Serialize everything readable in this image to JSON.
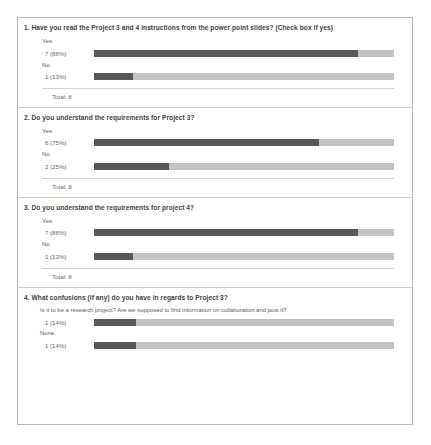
{
  "document": {
    "kind": "survey-results-summary",
    "colors": {
      "bar_fill": "#585858",
      "bar_track": "#c4c4c4",
      "page_border": "#b9b9b9",
      "text": "#5d5d63",
      "heading": "#3f3f46"
    }
  },
  "questions": [
    {
      "title": "1. Have you read the Project 3 and 4 instructions from the power point slides? (Check box if yes)",
      "answers": [
        {
          "label": "Yes",
          "count_text": "7 (88%)",
          "count": 7,
          "percent": 88
        },
        {
          "label": "No",
          "count_text": "1 (13%)",
          "count": 1,
          "percent": 13
        }
      ],
      "total_text": "Total: 8",
      "total": 8
    },
    {
      "title": "2. Do you understand the requirements for Project 3?",
      "answers": [
        {
          "label": "Yes",
          "count_text": "6 (75%)",
          "count": 6,
          "percent": 75
        },
        {
          "label": "No",
          "count_text": "2 (25%)",
          "count": 2,
          "percent": 25
        }
      ],
      "total_text": "Total: 8",
      "total": 8
    },
    {
      "title": "3. Do you understand the requirements for project 4?",
      "answers": [
        {
          "label": "Yes",
          "count_text": "7 (88%)",
          "count": 7,
          "percent": 88
        },
        {
          "label": "No",
          "count_text": "1 (13%)",
          "count": 1,
          "percent": 13
        }
      ],
      "total_text": "Total: 8",
      "total": 8
    },
    {
      "title": "4. What confusions (if any) do you have in regards to Project 3?",
      "answers": [
        {
          "label": "Is it to be a research project? Are we supposed to find information on collaboration and post it?",
          "count_text": "1 (14%)",
          "count": 1,
          "percent": 14,
          "freeform": true
        },
        {
          "label": "None.",
          "count_text": "1 (14%)",
          "count": 1,
          "percent": 14,
          "freeform": true
        }
      ],
      "total_text": "",
      "total": 7
    }
  ],
  "chart_data": {
    "type": "bar",
    "xlabel": "",
    "ylabel": "",
    "xlim": [
      0,
      100
    ],
    "grid": false,
    "legend": "none",
    "orientation": "horizontal",
    "groups": [
      {
        "question": "1. Have you read the Project 3 and 4 instructions from the power point slides? (Check box if yes)",
        "categories": [
          "Yes",
          "No"
        ],
        "values": [
          88,
          13
        ],
        "counts": [
          7,
          1
        ],
        "total": 8
      },
      {
        "question": "2. Do you understand the requirements for Project 3?",
        "categories": [
          "Yes",
          "No"
        ],
        "values": [
          75,
          25
        ],
        "counts": [
          6,
          2
        ],
        "total": 8
      },
      {
        "question": "3. Do you understand the requirements for project 4?",
        "categories": [
          "Yes",
          "No"
        ],
        "values": [
          88,
          13
        ],
        "counts": [
          7,
          1
        ],
        "total": 8
      },
      {
        "question": "4. What confusions (if any) do you have in regards to Project 3?",
        "categories": [
          "Is it to be a research project? Are we supposed to find information on collaboration and post it?",
          "None."
        ],
        "values": [
          14,
          14
        ],
        "counts": [
          1,
          1
        ],
        "total": 7
      }
    ]
  }
}
